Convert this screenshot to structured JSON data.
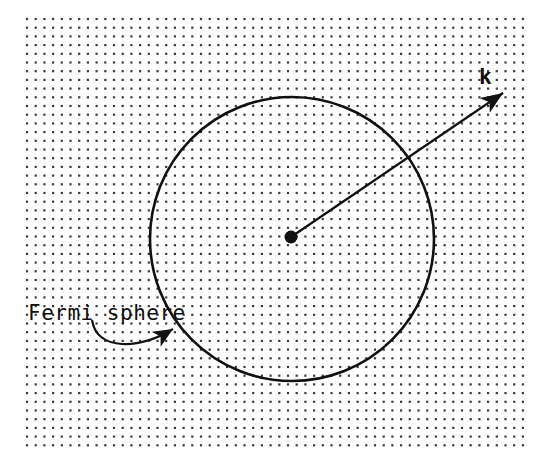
{
  "figure": {
    "background_color": "#ffffff",
    "ink_color": "#101010",
    "dot_color": "#3a3a3a",
    "width": 543,
    "height": 469
  },
  "labels": {
    "fermi_sphere": "Fermi sphere",
    "k_vector": "k"
  },
  "chart_data": {
    "type": "scatter",
    "title": "Fermi sphere",
    "xlabel": "",
    "ylabel": "",
    "grid": true,
    "legend": "none",
    "lattice": {
      "name": "k-point grid",
      "x_start": 27,
      "y_start": 19,
      "x_end": 525,
      "y_end": 452,
      "spacing_x": 8.7,
      "spacing_y": 8.7,
      "dot_size": 2.2,
      "columns": 58,
      "rows": 51
    },
    "circle": {
      "name": "Fermi sphere",
      "center_x": 292,
      "center_y": 239,
      "radius": 142,
      "stroke_width": 2.6
    },
    "origin_dot": {
      "name": "origin",
      "x": 291,
      "y": 237,
      "radius": 6.5
    },
    "k_arrow": {
      "name": "k vector",
      "from_x": 291,
      "from_y": 237,
      "to_x": 503,
      "to_y": 93,
      "stroke_width": 2.2,
      "head_length": 18,
      "head_width": 7
    },
    "leader": {
      "name": "Fermi sphere leader line",
      "start_x": 92,
      "start_y": 320,
      "control1_x": 97,
      "control1_y": 352,
      "control2_x": 140,
      "control2_y": 349,
      "end_x": 173,
      "end_y": 329,
      "stroke_width": 2.2
    },
    "text_positions": {
      "fermi_sphere_x": 28,
      "fermi_sphere_y": 320,
      "k_x": 479,
      "k_y": 84
    }
  }
}
